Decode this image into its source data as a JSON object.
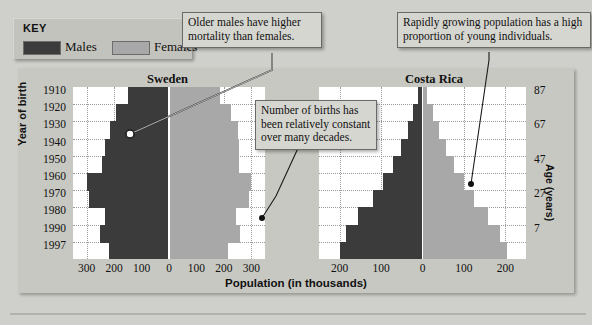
{
  "key": {
    "title": "KEY",
    "entries": [
      {
        "label": "Males",
        "color": "#3b3b3b",
        "name": "males"
      },
      {
        "label": "Females",
        "color": "#a8a8a8",
        "name": "females"
      }
    ]
  },
  "callouts": [
    {
      "id": "mortality",
      "text": "Older males have higher mortality than females."
    },
    {
      "id": "growth",
      "text": "Rapidly growing population has a high proportion of young individuals."
    },
    {
      "id": "births",
      "text": "Number of births has been relatively constant over many decades."
    }
  ],
  "axes": {
    "y_title": "Year of birth",
    "y_ticks": [
      "1910",
      "1920",
      "1930",
      "1940",
      "1950",
      "1960",
      "1970",
      "1980",
      "1990",
      "1997"
    ],
    "age_title": "Age (years)",
    "age_ticks": [
      "87",
      "67",
      "47",
      "27",
      "7"
    ],
    "x_title": "Population (in thousands)"
  },
  "chart_data": [
    {
      "type": "bar",
      "title": "Sweden",
      "xlabel": "Population (in thousands)",
      "ylabel": "Year of birth",
      "orientation": "population-pyramid",
      "xlim": [
        -350,
        350
      ],
      "xticks": [
        "300",
        "200",
        "100",
        "0",
        "100",
        "200",
        "300"
      ],
      "xtick_values": [
        -300,
        -200,
        -100,
        0,
        100,
        200,
        300
      ],
      "grid": true,
      "categories": [
        "1910",
        "1920",
        "1930",
        "1940",
        "1950",
        "1960",
        "1970",
        "1980",
        "1990",
        "1997"
      ],
      "series": [
        {
          "name": "Males",
          "color": "#3b3b3b",
          "values": [
            150,
            195,
            215,
            235,
            245,
            300,
            290,
            235,
            250,
            220
          ]
        },
        {
          "name": "Females",
          "color": "#a8a8a8",
          "values": [
            185,
            225,
            250,
            255,
            255,
            300,
            290,
            245,
            260,
            215
          ]
        }
      ]
    },
    {
      "type": "bar",
      "title": "Costa Rica",
      "xlabel": "Population (in thousands)",
      "ylabel": "Year of birth",
      "orientation": "population-pyramid",
      "xlim": [
        -250,
        250
      ],
      "xticks": [
        "200",
        "100",
        "0",
        "100",
        "200"
      ],
      "xtick_values": [
        -200,
        -100,
        0,
        100,
        200
      ],
      "grid": true,
      "categories": [
        "1910",
        "1920",
        "1930",
        "1940",
        "1950",
        "1960",
        "1970",
        "1980",
        "1990",
        "1997"
      ],
      "series": [
        {
          "name": "Males",
          "color": "#3b3b3b",
          "values": [
            10,
            22,
            36,
            52,
            72,
            95,
            120,
            155,
            185,
            200
          ]
        },
        {
          "name": "Females",
          "color": "#a8a8a8",
          "values": [
            12,
            25,
            40,
            56,
            76,
            100,
            125,
            158,
            188,
            205
          ]
        }
      ]
    }
  ]
}
